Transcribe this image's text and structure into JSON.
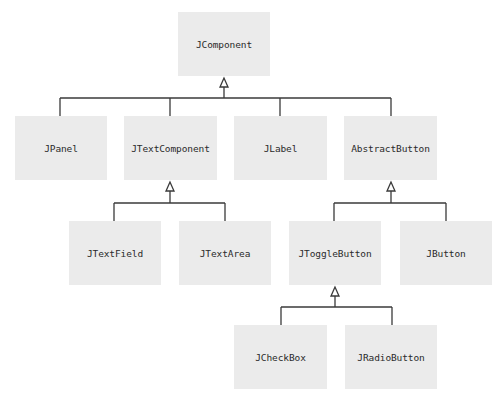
{
  "diagram": {
    "title": "",
    "colors": {
      "node_fill": "#ebebeb",
      "line": "#3a3a3a",
      "text": "#2a2a2a"
    },
    "nodes": [
      {
        "id": "jcomponent",
        "label": "JComponent",
        "x": 178,
        "y": 12,
        "w": 92,
        "h": 64
      },
      {
        "id": "jpanel",
        "label": "JPanel",
        "x": 15,
        "y": 116,
        "w": 92,
        "h": 64
      },
      {
        "id": "jtextcomponent",
        "label": "JTextComponent",
        "x": 124,
        "y": 116,
        "w": 93,
        "h": 64
      },
      {
        "id": "jlabel",
        "label": "JLabel",
        "x": 234,
        "y": 116,
        "w": 93,
        "h": 64
      },
      {
        "id": "abstractbutton",
        "label": "AbstractButton",
        "x": 344,
        "y": 116,
        "w": 93,
        "h": 64
      },
      {
        "id": "jtextfield",
        "label": "JTextField",
        "x": 69,
        "y": 221,
        "w": 92,
        "h": 64
      },
      {
        "id": "jtextarea",
        "label": "JTextArea",
        "x": 179,
        "y": 221,
        "w": 92,
        "h": 64
      },
      {
        "id": "jtogglebutton",
        "label": "JToggleButton",
        "x": 289,
        "y": 221,
        "w": 92,
        "h": 64
      },
      {
        "id": "jbutton",
        "label": "JButton",
        "x": 400,
        "y": 221,
        "w": 92,
        "h": 64
      },
      {
        "id": "jcheckbox",
        "label": "JCheckBox",
        "x": 234,
        "y": 325,
        "w": 93,
        "h": 64
      },
      {
        "id": "jradiobutton",
        "label": "JRadioButton",
        "x": 345,
        "y": 325,
        "w": 92,
        "h": 64
      }
    ],
    "edges": [
      {
        "parent": "jcomponent",
        "children": [
          "jpanel",
          "jtextcomponent",
          "jlabel",
          "abstractbutton"
        ],
        "relation": "inheritance"
      },
      {
        "parent": "jtextcomponent",
        "children": [
          "jtextfield",
          "jtextarea"
        ],
        "relation": "inheritance"
      },
      {
        "parent": "abstractbutton",
        "children": [
          "jtogglebutton",
          "jbutton"
        ],
        "relation": "inheritance"
      },
      {
        "parent": "jtogglebutton",
        "children": [
          "jcheckbox",
          "jradiobutton"
        ],
        "relation": "inheritance"
      }
    ]
  }
}
